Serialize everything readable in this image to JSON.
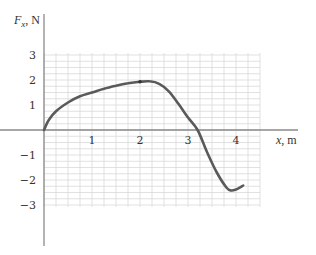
{
  "chart_data": {
    "type": "line",
    "title": "",
    "xlabel": "x, m",
    "ylabel": "F_x, N",
    "ylabel_main": "F",
    "ylabel_sub": "x",
    "ylabel_unit": ", N",
    "xlabel_var": "x",
    "xlabel_unit": ", m",
    "xlim": [
      0,
      4.5
    ],
    "ylim": [
      -3,
      3
    ],
    "grid": true,
    "grid_step": 0.25,
    "x_ticks": [
      1,
      2,
      3,
      4
    ],
    "x_tick_labels": [
      "1",
      "2",
      "3",
      "4"
    ],
    "y_ticks": [
      3,
      2,
      1,
      -1,
      -2,
      -3
    ],
    "y_tick_labels": [
      "3",
      "2",
      "1",
      "−1",
      "−2",
      "−3"
    ],
    "series": [
      {
        "name": "F_x(x)",
        "color": "#5a5a5a",
        "x": [
          0,
          0.1,
          0.25,
          0.5,
          0.75,
          1.0,
          1.25,
          1.5,
          1.75,
          2.0,
          2.2,
          2.4,
          2.6,
          2.8,
          3.0,
          3.2,
          3.4,
          3.6,
          3.8,
          3.9,
          4.0,
          4.15
        ],
        "y": [
          0,
          0.4,
          0.75,
          1.1,
          1.35,
          1.5,
          1.65,
          1.77,
          1.87,
          1.93,
          1.95,
          1.85,
          1.55,
          1.05,
          0.5,
          0.0,
          -0.9,
          -1.7,
          -2.3,
          -2.42,
          -2.38,
          -2.22
        ]
      }
    ],
    "marker_points": [
      {
        "x": 2.0,
        "y": 1.93
      }
    ]
  }
}
